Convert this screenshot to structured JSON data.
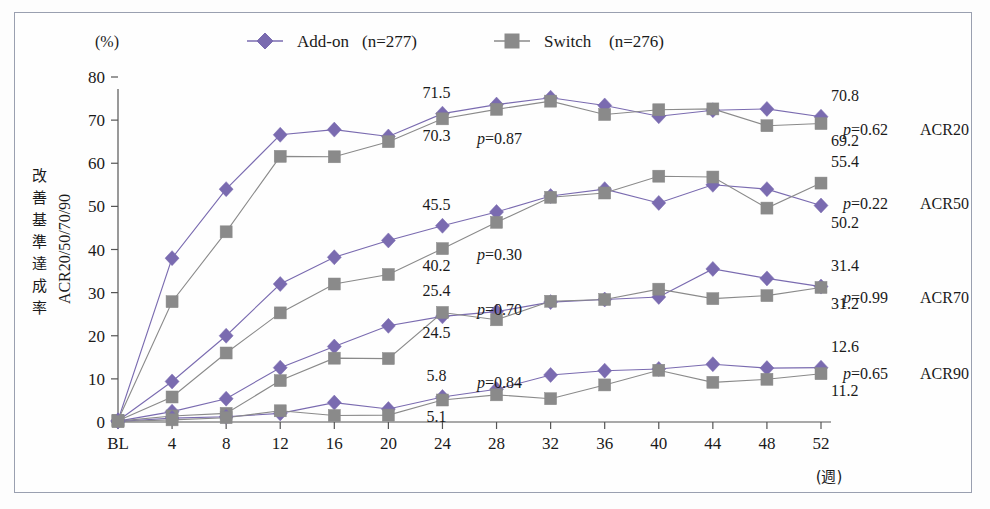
{
  "figure": {
    "unit_label": "(%)",
    "x_unit_label": "(週)",
    "y_axis_title_jp": "改善基準達成率",
    "y_axis_title_en": "ACR20/50/70/90",
    "frame_border_color": "#9aa0b0",
    "background": "#fefefe"
  },
  "legend": {
    "position": "top-center",
    "entries": [
      {
        "label": "Add-on",
        "n_text": "(n=277)",
        "marker": "diamond",
        "color": "#7a6bb0"
      },
      {
        "label": "Switch",
        "n_text": "(n=276)",
        "marker": "square",
        "color": "#8a8a8a"
      }
    ]
  },
  "axes": {
    "y_ticks": [
      0,
      10,
      20,
      30,
      40,
      50,
      60,
      70,
      80
    ],
    "y_tick_labels": [
      "0",
      "10",
      "20",
      "30",
      "40",
      "50",
      "60",
      "70",
      "80"
    ],
    "ylim": [
      0,
      80
    ],
    "x_tick_labels": [
      "BL",
      "4",
      "8",
      "12",
      "16",
      "20",
      "24",
      "28",
      "32",
      "36",
      "40",
      "44",
      "48",
      "52"
    ],
    "grid": false
  },
  "chart_data": {
    "type": "line",
    "title": "",
    "xlabel": "(週)",
    "ylabel": "改善基準達成率 ACR20/50/70/90",
    "ylim": [
      0,
      80
    ],
    "categories": [
      "BL",
      "4",
      "8",
      "12",
      "16",
      "20",
      "24",
      "28",
      "32",
      "36",
      "40",
      "44",
      "48",
      "52"
    ],
    "groups": [
      {
        "name": "ACR20",
        "p_label": "p=0.62",
        "series": [
          {
            "name": "Add-on",
            "color": "#7a6bb0",
            "marker": "diamond",
            "values": [
              0.4,
              38.0,
              54.0,
              66.6,
              67.8,
              66.2,
              71.5,
              73.6,
              75.2,
              73.4,
              70.9,
              72.3,
              72.6,
              70.8
            ]
          },
          {
            "name": "Switch",
            "color": "#8a8a8a",
            "marker": "square",
            "values": [
              0.4,
              27.9,
              44.1,
              61.6,
              61.5,
              65.0,
              70.3,
              72.5,
              74.4,
              71.3,
              72.4,
              72.6,
              68.7,
              69.2
            ]
          }
        ],
        "annotations": [
          {
            "text": "71.5",
            "at_week": "24",
            "series": "Add-on"
          },
          {
            "text": "70.3",
            "at_week": "24",
            "series": "Switch"
          },
          {
            "text": "70.8",
            "at_week": "52",
            "series": "Add-on"
          },
          {
            "text": "69.2",
            "at_week": "52",
            "series": "Switch"
          }
        ]
      },
      {
        "name": "ACR50",
        "p_label": "p=0.22",
        "series": [
          {
            "name": "Add-on",
            "color": "#7a6bb0",
            "marker": "diamond",
            "values": [
              0.3,
              9.4,
              20.0,
              32.0,
              38.2,
              42.1,
              45.5,
              48.7,
              52.4,
              54.0,
              50.8,
              55.0,
              54.0,
              50.2
            ]
          },
          {
            "name": "Switch",
            "color": "#8a8a8a",
            "marker": "square",
            "values": [
              0.3,
              5.8,
              16.0,
              25.3,
              32.0,
              34.2,
              40.2,
              46.3,
              52.1,
              53.1,
              57.0,
              56.8,
              49.6,
              55.4
            ]
          }
        ],
        "annotations": [
          {
            "text": "45.5",
            "at_week": "24",
            "series": "Add-on"
          },
          {
            "text": "40.2",
            "at_week": "24",
            "series": "Switch"
          },
          {
            "text": "55.4",
            "at_week": "52",
            "series": "Switch"
          },
          {
            "text": "50.2",
            "at_week": "52",
            "series": "Add-on"
          }
        ]
      },
      {
        "name": "ACR70",
        "p_label": "p=0.99",
        "series": [
          {
            "name": "Add-on",
            "color": "#7a6bb0",
            "marker": "diamond",
            "values": [
              0.2,
              2.4,
              5.4,
              12.6,
              17.5,
              22.3,
              24.5,
              25.6,
              27.8,
              28.4,
              29.0,
              35.5,
              33.3,
              31.4
            ]
          },
          {
            "name": "Switch",
            "color": "#8a8a8a",
            "marker": "square",
            "values": [
              0.2,
              1.4,
              2.0,
              9.6,
              14.8,
              14.7,
              25.4,
              23.7,
              28.0,
              28.4,
              30.8,
              28.6,
              29.3,
              31.2
            ]
          }
        ],
        "annotations": [
          {
            "text": "25.4",
            "at_week": "24",
            "series": "Switch"
          },
          {
            "text": "24.5",
            "at_week": "24",
            "series": "Add-on"
          },
          {
            "text": "31.4",
            "at_week": "52",
            "series": "Add-on"
          },
          {
            "text": "31.2",
            "at_week": "52",
            "series": "Switch"
          }
        ]
      },
      {
        "name": "ACR90",
        "p_label": "p=0.65",
        "series": [
          {
            "name": "Add-on",
            "color": "#7a6bb0",
            "marker": "diamond",
            "values": [
              0.1,
              0.9,
              1.2,
              2.0,
              4.5,
              3.0,
              5.8,
              7.6,
              10.9,
              11.9,
              12.3,
              13.4,
              12.5,
              12.6
            ]
          },
          {
            "name": "Switch",
            "color": "#8a8a8a",
            "marker": "square",
            "values": [
              0.1,
              0.5,
              1.0,
              2.6,
              1.5,
              1.6,
              5.1,
              6.3,
              5.4,
              8.6,
              12.0,
              9.2,
              9.9,
              11.2
            ]
          }
        ],
        "annotations": [
          {
            "text": "5.8",
            "at_week": "24",
            "series": "Add-on"
          },
          {
            "text": "5.1",
            "at_week": "24",
            "series": "Switch"
          },
          {
            "text": "12.6",
            "at_week": "52",
            "series": "Add-on"
          },
          {
            "text": "11.2",
            "at_week": "52",
            "series": "Switch"
          }
        ]
      }
    ],
    "inline_p_values": [
      {
        "text": "p=0.87",
        "group": "ACR20"
      },
      {
        "text": "p=0.30",
        "group": "ACR50"
      },
      {
        "text": "p=0.70",
        "group": "ACR70"
      },
      {
        "text": "p=0.84",
        "group": "ACR90"
      }
    ],
    "right_labels": [
      {
        "p": "p=0.62",
        "name": "ACR20"
      },
      {
        "p": "p=0.22",
        "name": "ACR50"
      },
      {
        "p": "p=0.99",
        "name": "ACR70"
      },
      {
        "p": "p=0.65",
        "name": "ACR90"
      }
    ]
  }
}
